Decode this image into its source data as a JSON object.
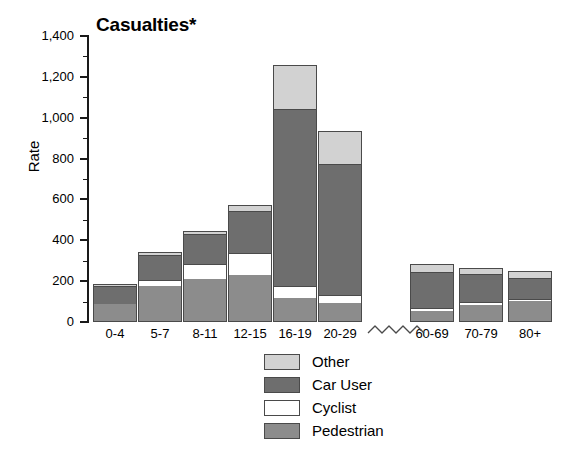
{
  "chart_data": {
    "type": "bar",
    "title": "Casualties*",
    "subtitle": "",
    "xlabel": "",
    "ylabel": "Rate",
    "stacked": true,
    "grid": false,
    "legend_position": "bottom-center",
    "ylim": [
      0,
      1400
    ],
    "ytick_step": 200,
    "yminor_step": 100,
    "ytick_labels": [
      "0",
      "200",
      "400",
      "600",
      "800",
      "1,000",
      "1,200",
      "1,400"
    ],
    "ytick_values": [
      0,
      200,
      400,
      600,
      800,
      1000,
      1200,
      1400
    ],
    "categories": [
      "0-4",
      "5-7",
      "8-11",
      "12-15",
      "16-19",
      "20-29",
      "60-69",
      "70-79",
      "80+"
    ],
    "axis_break": {
      "present": true,
      "style": "zigzag",
      "after_category": "20-29",
      "before_category": "60-69"
    },
    "series": [
      {
        "name": "Pedestrian",
        "color": "#8c8c8c",
        "values": [
          90,
          175,
          210,
          230,
          120,
          95,
          55,
          85,
          105
        ]
      },
      {
        "name": "Cyclist",
        "color": "#ffffff",
        "values": [
          0,
          30,
          75,
          110,
          55,
          35,
          15,
          15,
          10
        ]
      },
      {
        "name": "Car User",
        "color": "#6e6e6e",
        "values": [
          85,
          125,
          145,
          205,
          870,
          645,
          175,
          135,
          100
        ]
      },
      {
        "name": "Other",
        "color": "#d2d2d2",
        "values": [
          10,
          15,
          15,
          30,
          213,
          160,
          40,
          30,
          35
        ]
      }
    ],
    "totals": [
      185,
      345,
      445,
      575,
      1258,
      935,
      285,
      265,
      250
    ],
    "legend_entries": [
      {
        "label": "Other",
        "color": "#d2d2d2"
      },
      {
        "label": "Car User",
        "color": "#6e6e6e"
      },
      {
        "label": "Cyclist",
        "color": "#ffffff"
      },
      {
        "label": "Pedestrian",
        "color": "#8c8c8c"
      }
    ]
  }
}
